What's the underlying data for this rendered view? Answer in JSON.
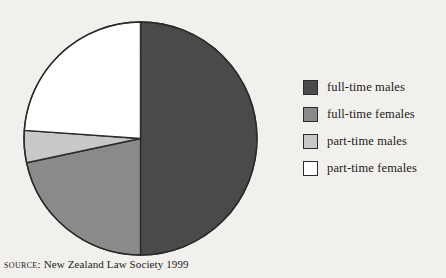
{
  "chart_data": {
    "type": "pie",
    "title": "",
    "subtitle": "",
    "xlabel": "",
    "ylabel": "",
    "grid": false,
    "legend_position": "right",
    "start_angle_deg": 0,
    "direction": "clockwise",
    "categories": [
      "full-time males",
      "full-time females",
      "part-time males",
      "part-time females"
    ],
    "values": [
      50.0,
      21.7,
      4.4,
      23.9
    ],
    "value_unit": "percent",
    "angles_deg": [
      180,
      78,
      16,
      86
    ],
    "colors": [
      "#4a4a4a",
      "#8a8a8a",
      "#c8c8c8",
      "#ffffff"
    ],
    "slices": [
      {
        "label": "full-time males",
        "value": 50.0,
        "angle_deg": 180,
        "color": "#4a4a4a"
      },
      {
        "label": "full-time females",
        "value": 21.7,
        "angle_deg": 78,
        "color": "#8a8a8a"
      },
      {
        "label": "part-time males",
        "value": 4.4,
        "angle_deg": 16,
        "color": "#c8c8c8"
      },
      {
        "label": "part-time females",
        "value": 23.9,
        "angle_deg": 86,
        "color": "#ffffff"
      }
    ]
  },
  "legend": {
    "items": [
      {
        "label": "full-time males",
        "color": "#4a4a4a"
      },
      {
        "label": "full-time females",
        "color": "#8a8a8a"
      },
      {
        "label": "part-time males",
        "color": "#c8c8c8"
      },
      {
        "label": "part-time females",
        "color": "#ffffff"
      }
    ]
  },
  "source": {
    "label": "Source:",
    "text": "New Zealand Law Society 1999"
  },
  "style": {
    "background": "#f2f0ec",
    "outline": "#2b2b2b",
    "text": "#1a1a1a"
  }
}
